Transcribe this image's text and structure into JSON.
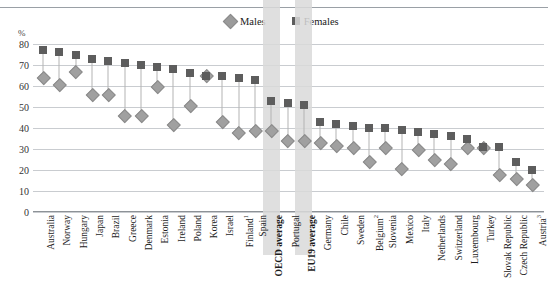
{
  "cropped_title_fragment": "",
  "unit_label": "%",
  "legend": {
    "males": {
      "label": "Males",
      "marker": "diamond-marker-icon",
      "color": "#9b9b9b"
    },
    "females": {
      "label": "Females",
      "marker": "square-marker-icon",
      "color": "#5d5d5d"
    }
  },
  "chart_data": {
    "type": "scatter",
    "title": "",
    "xlabel": "",
    "ylabel": "%",
    "ylim": [
      0,
      80
    ],
    "yticks": [
      0,
      10,
      20,
      30,
      40,
      50,
      60,
      70,
      80
    ],
    "grid": true,
    "legend_position": "top-center",
    "categories": [
      "Australia",
      "Norway",
      "Hungary",
      "Japan",
      "Brazil",
      "Greece",
      "Denmark",
      "Estonia",
      "Ireland",
      "Poland",
      "Korea",
      "Israel",
      "Finland¹",
      "Spain",
      "OECD average",
      "Portugal",
      "EU19 average",
      "Germany",
      "Chile",
      "Sweden",
      "Belgium²",
      "Slovenia",
      "Mexico",
      "Italy",
      "Netherlands",
      "Switzerland",
      "Luxembourg",
      "Turkey",
      "Slovak Republic",
      "Czech Republic",
      "Austria³"
    ],
    "highlighted_categories": [
      "OECD average",
      "EU19 average"
    ],
    "series": [
      {
        "name": "Females",
        "marker": "square",
        "color": "#5d5d5d",
        "values": [
          77,
          76,
          75,
          73,
          72,
          71,
          70,
          69,
          68,
          66,
          65,
          65,
          64,
          63,
          53,
          52,
          51,
          43,
          42,
          41,
          40,
          40,
          39,
          38,
          37,
          36,
          35,
          31,
          31,
          24,
          20
        ]
      },
      {
        "name": "Males",
        "marker": "diamond",
        "color": "#a0a0a0",
        "values": [
          64,
          61,
          67,
          56,
          56,
          46,
          46,
          60,
          42,
          51,
          65,
          43,
          38,
          39,
          39,
          34,
          34,
          33,
          32,
          31,
          24,
          31,
          21,
          30,
          25,
          23,
          31,
          31,
          18,
          16,
          13
        ]
      }
    ]
  },
  "footnote_markers": {
    "finland": "1",
    "belgium": "2",
    "austria": "3"
  }
}
